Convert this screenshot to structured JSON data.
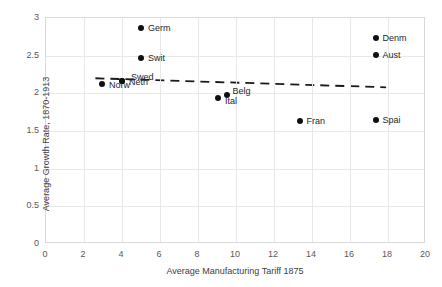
{
  "chart_data": {
    "type": "scatter",
    "title": "",
    "xlabel": "Average Manufacturing Tariff 1875",
    "ylabel": "Average Growth Rate, 1870-1913",
    "xlim": [
      0,
      20
    ],
    "ylim": [
      0,
      3
    ],
    "xticks": [
      "0",
      "2",
      "4",
      "6",
      "8",
      "10",
      "12",
      "14",
      "16",
      "18",
      "20"
    ],
    "yticks": [
      "0",
      "0.5",
      "1",
      "1.5",
      "2",
      "2.5",
      "3"
    ],
    "grid": true,
    "legend": "none",
    "points": [
      {
        "label": "Norw",
        "x": 3.0,
        "y": 2.11,
        "label_dx": 7,
        "label_dy": 1
      },
      {
        "label": "Neth",
        "x": 4.05,
        "y": 2.15,
        "label_dx": 7,
        "label_dy": 1
      },
      {
        "label": "Swed",
        "x": 4.05,
        "y": 2.15,
        "label_dx": 9,
        "label_dy": -4
      },
      {
        "label": "Germ",
        "x": 5.05,
        "y": 2.85,
        "label_dx": 7,
        "label_dy": 0
      },
      {
        "label": "Swit",
        "x": 5.05,
        "y": 2.45,
        "label_dx": 7,
        "label_dy": 0
      },
      {
        "label": "Ital",
        "x": 9.1,
        "y": 1.93,
        "label_dx": 7,
        "label_dy": 3
      },
      {
        "label": "Belg",
        "x": 9.6,
        "y": 1.96,
        "label_dx": 5,
        "label_dy": -4
      },
      {
        "label": "Fran",
        "x": 13.4,
        "y": 1.62,
        "label_dx": 7,
        "label_dy": 0
      },
      {
        "label": "Denm",
        "x": 17.4,
        "y": 2.72,
        "label_dx": 7,
        "label_dy": 0
      },
      {
        "label": "Aust",
        "x": 17.4,
        "y": 2.5,
        "label_dx": 7,
        "label_dy": 0
      },
      {
        "label": "Spai",
        "x": 17.4,
        "y": 1.63,
        "label_dx": 7,
        "label_dy": 0
      }
    ],
    "trendline": {
      "style": "dashed",
      "x_start": 2.6,
      "y_start": 2.2,
      "x_end": 17.9,
      "y_end": 2.08
    },
    "colors": {
      "marker": "#101010",
      "trendline": "#1a1a1a",
      "grid": "#e8e8e8",
      "axis_text": "#595959",
      "plot_border": "#d9d9d9"
    }
  }
}
